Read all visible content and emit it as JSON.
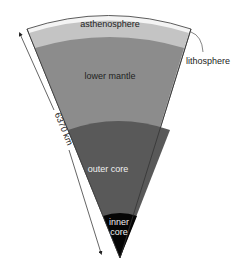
{
  "diagram": {
    "type": "earth-interior-cross-section",
    "layers": [
      {
        "id": "lithosphere",
        "label": "lithosphere",
        "color": "#f4f4f4"
      },
      {
        "id": "asthenosphere",
        "label": "asthenosphere",
        "color": "#c4c4c4"
      },
      {
        "id": "lower-mantle",
        "label": "lower mantle",
        "color": "#8c8c8c"
      },
      {
        "id": "outer-core",
        "label": "outer core",
        "color": "#595959"
      },
      {
        "id": "inner-core",
        "label": "inner core",
        "label_line1": "inner",
        "label_line2": "core",
        "color": "#050505"
      }
    ],
    "radius_label": "6370 km",
    "text_colors": {
      "dark": "#222222",
      "light": "#f0f0f0"
    }
  }
}
